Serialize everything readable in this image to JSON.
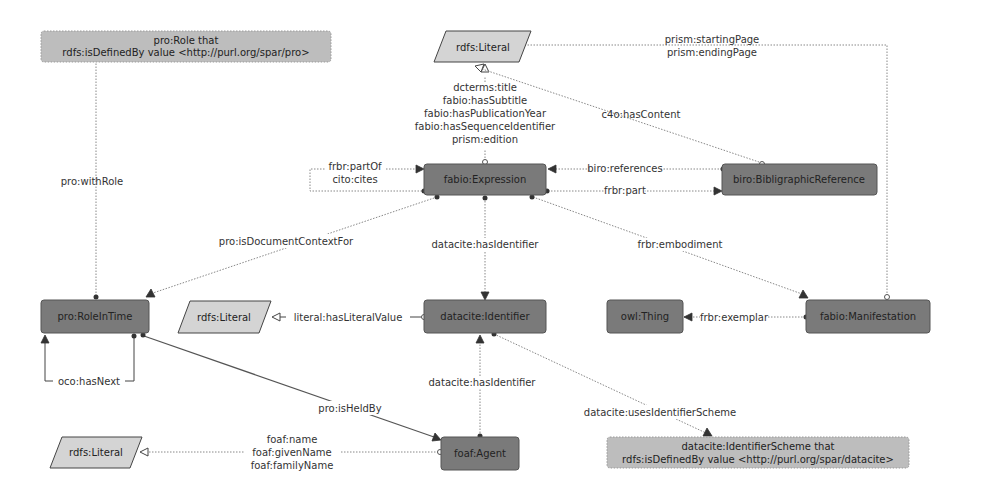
{
  "diagram": {
    "nodes": {
      "pro_role": {
        "line1": "pro:Role that",
        "line2": "rdfs:isDefinedBy value <http://purl.org/spar/pro>"
      },
      "rdfs_literal_top": {
        "label": "rdfs:Literal"
      },
      "fabio_expression": {
        "label": "fabio:Expression"
      },
      "biro_bibref": {
        "label": "biro:BibligraphicReference"
      },
      "pro_roleintime": {
        "label": "pro:RoleInTime"
      },
      "rdfs_literal_mid": {
        "label": "rdfs:Literal"
      },
      "datacite_identifier": {
        "label": "datacite:Identifier"
      },
      "owl_thing": {
        "label": "owl:Thing"
      },
      "fabio_manifestation": {
        "label": "fabio:Manifestation"
      },
      "rdfs_literal_bottom": {
        "label": "rdfs:Literal"
      },
      "foaf_agent": {
        "label": "foaf:Agent"
      },
      "datacite_scheme": {
        "line1": "datacite:IdentifierScheme that",
        "line2": "rdfs:isDefinedBy value  <http://purl.org/spar/datacite>"
      }
    },
    "edges": {
      "prism_pages": [
        "prism:startingPage",
        "prism:endingPage"
      ],
      "expression_literals": [
        "dcterms:title",
        "fabio:hasSubtitle",
        "fabio:hasPublicationYear",
        "fabio:hasSequenceIdentifier",
        "prism:edition"
      ],
      "c4o_hascontent": "c4o:hasContent",
      "pro_withrole": "pro:withRole",
      "self_partof_cites": [
        "frbr:partOf",
        "cito:cites"
      ],
      "biro_references": "biro:references",
      "frbr_part": "frbr:part",
      "pro_isdocumentcontextfor": "pro:isDocumentContextFor",
      "datacite_hasidentifier_expr": "datacite:hasIdentifier",
      "frbr_embodiment": "frbr:embodiment",
      "literal_hasliteralvalue": "literal:hasLiteralValue",
      "frbr_exemplar": "frbr:exemplar",
      "oco_hasnext": "oco:hasNext",
      "datacite_hasidentifier_agent": "datacite:hasIdentifier",
      "pro_isheldby": "pro:isHeldBy",
      "datacite_usesidentifierscheme": "datacite:usesIdentifierScheme",
      "foaf_names": [
        "foaf:name",
        "foaf:givenName",
        "foaf:familyName"
      ]
    }
  }
}
